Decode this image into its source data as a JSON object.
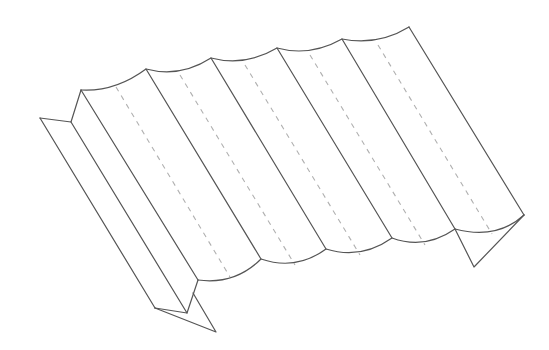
{
  "figure": {
    "stroke_color": "#555555",
    "dash_color": "#b0b0b0",
    "background": "#ffffff",
    "corrugation_count": 6,
    "fold_lines": "solid",
    "centerlines": "dashed"
  }
}
